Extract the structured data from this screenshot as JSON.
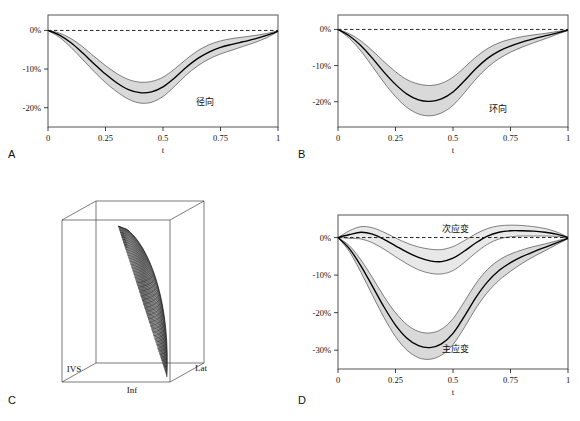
{
  "figure": {
    "panels": [
      "A",
      "B",
      "C",
      "D"
    ],
    "axis": {
      "x_label": "t",
      "x_ticks": [
        "0",
        "0.25",
        "0.5",
        "0.75",
        "1"
      ],
      "x_tick_values": [
        0,
        0.25,
        0.5,
        0.75,
        1
      ],
      "y_ticks_ab": [
        "0%",
        "-10%",
        "-20%"
      ],
      "y_tick_values_ab": [
        0,
        -10,
        -20
      ],
      "y_ticks_d": [
        "0%",
        "-10%",
        "-20%",
        "-30%"
      ],
      "y_tick_values_d": [
        0,
        -10,
        -20,
        -30
      ]
    },
    "colors": {
      "band_fill": "#d9d9d9",
      "band_fill_light": "#e8e8e8",
      "mean_line": "#000000",
      "frame": "#555555",
      "zero_line": "#111111"
    }
  },
  "panel_a": {
    "letter": "A",
    "label": "径向",
    "label_en": "radial"
  },
  "panel_b": {
    "letter": "B",
    "label": "环向",
    "label_en": "circumferential"
  },
  "panel_c": {
    "letter": "C",
    "labels": {
      "ivs": "IVS",
      "inf": "Inf",
      "lat": "Lat"
    },
    "description": "3D left-ventricle surface mesh with fiber streamlines in a wireframe bounding box"
  },
  "panel_d": {
    "letter": "D",
    "label_secondary": "次应变",
    "label_secondary_en": "secondary strain",
    "label_principal": "主应变",
    "label_principal_en": "principal strain"
  },
  "chart_data": [
    {
      "id": "panel_a",
      "type": "line",
      "title": "径向",
      "xlabel": "t",
      "ylabel": "",
      "xlim": [
        0,
        1
      ],
      "ylim": [
        -25,
        4
      ],
      "grid": false,
      "legend": "none",
      "x": [
        0,
        0.05,
        0.1,
        0.15,
        0.2,
        0.25,
        0.3,
        0.35,
        0.4,
        0.45,
        0.5,
        0.55,
        0.6,
        0.65,
        0.7,
        0.75,
        0.8,
        0.85,
        0.9,
        0.95,
        1
      ],
      "series": [
        {
          "name": "mean",
          "values": [
            0,
            -1.2,
            -3.2,
            -5.8,
            -8.6,
            -11.3,
            -13.6,
            -15.3,
            -16.1,
            -15.9,
            -14.6,
            -12.3,
            -9.6,
            -7.3,
            -5.6,
            -4.4,
            -3.6,
            -2.9,
            -2.2,
            -1.3,
            -0.2
          ]
        },
        {
          "name": "upper",
          "values": [
            0,
            -0.7,
            -2.1,
            -4.2,
            -6.7,
            -9.1,
            -11.2,
            -12.7,
            -13.4,
            -13.2,
            -12.1,
            -10.0,
            -7.5,
            -5.3,
            -3.7,
            -2.7,
            -2.1,
            -1.7,
            -1.3,
            -0.8,
            -0.1
          ]
        },
        {
          "name": "lower",
          "values": [
            0,
            -1.8,
            -4.4,
            -7.5,
            -10.6,
            -13.5,
            -15.9,
            -17.8,
            -18.8,
            -18.6,
            -17.1,
            -14.5,
            -11.6,
            -9.2,
            -7.4,
            -6.1,
            -5.1,
            -4.1,
            -3.1,
            -1.9,
            -0.3
          ]
        }
      ],
      "zero_reference": 0
    },
    {
      "id": "panel_b",
      "type": "line",
      "title": "环向",
      "xlabel": "t",
      "ylabel": "",
      "xlim": [
        0,
        1
      ],
      "ylim": [
        -27,
        4
      ],
      "grid": false,
      "legend": "none",
      "x": [
        0,
        0.05,
        0.1,
        0.15,
        0.2,
        0.25,
        0.3,
        0.35,
        0.4,
        0.45,
        0.5,
        0.55,
        0.6,
        0.65,
        0.7,
        0.75,
        0.8,
        0.85,
        0.9,
        0.95,
        1
      ],
      "series": [
        {
          "name": "mean",
          "values": [
            0,
            -1.8,
            -4.5,
            -8.0,
            -11.8,
            -15.2,
            -17.9,
            -19.5,
            -19.9,
            -19.2,
            -17.3,
            -14.2,
            -10.8,
            -8.0,
            -6.0,
            -4.6,
            -3.5,
            -2.6,
            -1.8,
            -1.0,
            -0.2
          ]
        },
        {
          "name": "upper",
          "values": [
            0,
            -1.2,
            -3.2,
            -5.9,
            -8.9,
            -11.7,
            -13.9,
            -15.1,
            -15.5,
            -14.9,
            -13.2,
            -10.5,
            -7.6,
            -5.3,
            -3.7,
            -2.7,
            -2.0,
            -1.5,
            -1.1,
            -0.6,
            -0.1
          ]
        },
        {
          "name": "lower",
          "values": [
            0,
            -2.5,
            -6.0,
            -10.3,
            -14.7,
            -18.6,
            -21.6,
            -23.4,
            -23.9,
            -23.1,
            -21.0,
            -17.5,
            -13.7,
            -10.5,
            -8.1,
            -6.3,
            -4.9,
            -3.7,
            -2.6,
            -1.4,
            -0.3
          ]
        }
      ],
      "zero_reference": 0
    },
    {
      "id": "panel_d_secondary",
      "type": "line",
      "title": "次应变",
      "xlabel": "t",
      "ylabel": "",
      "xlim": [
        0,
        1
      ],
      "ylim": [
        -35,
        6
      ],
      "grid": false,
      "legend": "none",
      "x": [
        0,
        0.05,
        0.1,
        0.15,
        0.2,
        0.25,
        0.3,
        0.35,
        0.4,
        0.45,
        0.5,
        0.55,
        0.6,
        0.65,
        0.7,
        0.75,
        0.8,
        0.85,
        0.9,
        0.95,
        1
      ],
      "series": [
        {
          "name": "mean",
          "values": [
            0,
            0.8,
            1.4,
            0.9,
            -0.5,
            -2.2,
            -3.9,
            -5.3,
            -6.2,
            -6.4,
            -5.5,
            -3.6,
            -1.4,
            0.4,
            1.4,
            1.8,
            1.8,
            1.7,
            1.4,
            0.9,
            0.0
          ]
        },
        {
          "name": "upper",
          "values": [
            0,
            1.8,
            2.9,
            2.6,
            1.4,
            -0.1,
            -1.5,
            -2.5,
            -3.1,
            -3.2,
            -2.4,
            -0.8,
            1.0,
            2.4,
            3.1,
            3.3,
            3.2,
            2.9,
            2.4,
            1.5,
            0.1
          ]
        },
        {
          "name": "lower",
          "values": [
            0,
            -0.2,
            -0.4,
            -1.4,
            -3.1,
            -5.1,
            -7.0,
            -8.6,
            -9.5,
            -9.7,
            -8.8,
            -6.6,
            -4.0,
            -1.8,
            -0.4,
            0.2,
            0.4,
            0.4,
            0.4,
            0.3,
            -0.1
          ]
        }
      ],
      "zero_reference": 0
    },
    {
      "id": "panel_d_principal",
      "type": "line",
      "title": "主应变",
      "xlabel": "t",
      "ylabel": "",
      "xlim": [
        0,
        1
      ],
      "ylim": [
        -35,
        6
      ],
      "grid": false,
      "legend": "none",
      "x": [
        0,
        0.05,
        0.1,
        0.15,
        0.2,
        0.25,
        0.3,
        0.35,
        0.4,
        0.45,
        0.5,
        0.55,
        0.6,
        0.65,
        0.7,
        0.75,
        0.8,
        0.85,
        0.9,
        0.95,
        1
      ],
      "series": [
        {
          "name": "mean",
          "values": [
            0,
            -3.0,
            -7.6,
            -13.0,
            -18.5,
            -23.3,
            -26.8,
            -28.8,
            -29.3,
            -28.3,
            -25.5,
            -20.9,
            -15.9,
            -11.8,
            -8.8,
            -6.7,
            -5.1,
            -3.8,
            -2.6,
            -1.4,
            -0.2
          ]
        },
        {
          "name": "upper",
          "values": [
            0,
            -2.2,
            -6.0,
            -10.7,
            -15.7,
            -20.0,
            -23.2,
            -25.0,
            -25.4,
            -24.4,
            -21.6,
            -17.0,
            -12.2,
            -8.5,
            -6.0,
            -4.4,
            -3.3,
            -2.4,
            -1.7,
            -0.9,
            -0.1
          ]
        },
        {
          "name": "lower",
          "values": [
            0,
            -3.8,
            -9.3,
            -15.4,
            -21.3,
            -26.4,
            -30.0,
            -32.0,
            -32.4,
            -31.3,
            -28.5,
            -23.9,
            -18.8,
            -14.6,
            -11.4,
            -9.0,
            -6.9,
            -5.1,
            -3.5,
            -1.9,
            -0.3
          ]
        }
      ],
      "zero_reference": 0
    }
  ]
}
